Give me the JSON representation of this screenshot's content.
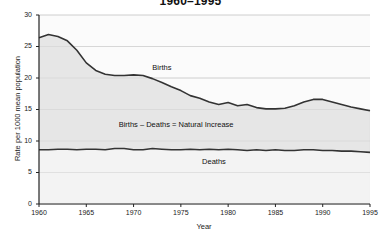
{
  "chart_data": {
    "type": "area",
    "title": "1960–1995",
    "xlabel": "Year",
    "ylabel": "Rate per 1000 mean population",
    "xlim": [
      1960,
      1995
    ],
    "ylim": [
      0,
      30
    ],
    "grid": true,
    "legend_position": "inline-annotations",
    "yticks": [
      0,
      5,
      10,
      15,
      20,
      25,
      30
    ],
    "ytick_labels": [
      "0",
      "5",
      "10",
      "15",
      "20",
      "25",
      "30"
    ],
    "xticks": [
      1960,
      1965,
      1970,
      1975,
      1980,
      1985,
      1990,
      1995
    ],
    "xtick_labels": [
      "1960",
      "1965",
      "1970",
      "1975",
      "1980",
      "1985",
      "1990",
      "1995"
    ],
    "annotations": [
      {
        "text": "Births",
        "x": 1973.0,
        "y": 21.6
      },
      {
        "text": "Births – Deaths = Natural Increase",
        "x": 1974.5,
        "y": 12.6
      },
      {
        "text": "Deaths",
        "x": 1978.5,
        "y": 6.7
      }
    ],
    "x": [
      1960,
      1961,
      1962,
      1963,
      1964,
      1965,
      1966,
      1967,
      1968,
      1969,
      1970,
      1971,
      1972,
      1973,
      1974,
      1975,
      1976,
      1977,
      1978,
      1979,
      1980,
      1981,
      1982,
      1983,
      1984,
      1985,
      1986,
      1987,
      1988,
      1989,
      1990,
      1991,
      1992,
      1993,
      1994,
      1995
    ],
    "series": [
      {
        "name": "Births",
        "color": "#333333",
        "fill": "#e3e3e3",
        "values": [
          26.4,
          26.9,
          26.6,
          25.9,
          24.4,
          22.4,
          21.2,
          20.6,
          20.4,
          20.4,
          20.5,
          20.4,
          19.9,
          19.3,
          18.6,
          18.0,
          17.2,
          16.8,
          16.2,
          15.8,
          16.1,
          15.6,
          15.8,
          15.3,
          15.1,
          15.1,
          15.2,
          15.6,
          16.2,
          16.6,
          16.6,
          16.2,
          15.8,
          15.4,
          15.1,
          14.8
        ]
      },
      {
        "name": "Deaths",
        "color": "#333333",
        "fill": "#f2f2f2",
        "values": [
          8.6,
          8.6,
          8.7,
          8.7,
          8.6,
          8.7,
          8.7,
          8.6,
          8.8,
          8.8,
          8.6,
          8.6,
          8.8,
          8.7,
          8.6,
          8.6,
          8.7,
          8.6,
          8.7,
          8.6,
          8.7,
          8.6,
          8.5,
          8.6,
          8.5,
          8.6,
          8.5,
          8.5,
          8.6,
          8.6,
          8.5,
          8.5,
          8.4,
          8.4,
          8.3,
          8.2
        ]
      }
    ]
  }
}
